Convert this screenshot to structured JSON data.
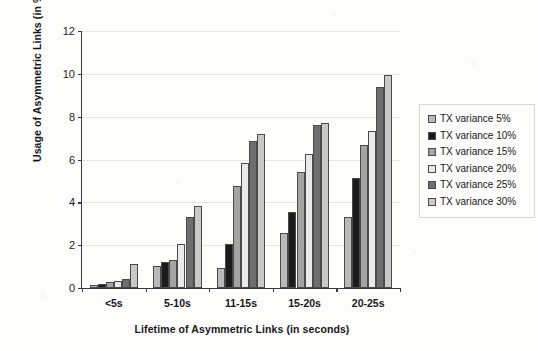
{
  "chart_data": {
    "type": "bar",
    "title": "",
    "subtitle": "",
    "xlabel": "Lifetime of Asymmetric Links (in seconds)",
    "ylabel": "Usage of Asymmetric Links (in %)",
    "categories": [
      "<5s",
      "5-10s",
      "11-15s",
      "15-20s",
      "20-25s"
    ],
    "ylim": [
      0,
      12
    ],
    "yticks": [
      0,
      2,
      4,
      6,
      8,
      10,
      12
    ],
    "grid": "horizontal",
    "legend_position": "right",
    "series": [
      {
        "name": "TX variance 5%",
        "color": "#b9b9b7",
        "values": [
          0.15,
          1.05,
          0.95,
          2.55,
          3.3
        ]
      },
      {
        "name": "TX variance 10%",
        "color": "#1b1b1b",
        "values": [
          0.2,
          1.2,
          2.05,
          3.55,
          5.15
        ]
      },
      {
        "name": "TX variance 15%",
        "color": "#a3a3a1",
        "values": [
          0.3,
          1.3,
          4.75,
          5.4,
          6.7
        ]
      },
      {
        "name": "TX variance 20%",
        "color": "#e9e9e7",
        "values": [
          0.35,
          2.05,
          5.85,
          6.25,
          7.35
        ]
      },
      {
        "name": "TX variance 25%",
        "color": "#6e6e6e",
        "values": [
          0.4,
          3.3,
          6.85,
          7.6,
          9.4
        ]
      },
      {
        "name": "TX variance 30%",
        "color": "#c9c9c7",
        "values": [
          1.1,
          3.85,
          7.2,
          7.7,
          9.95
        ]
      }
    ]
  }
}
